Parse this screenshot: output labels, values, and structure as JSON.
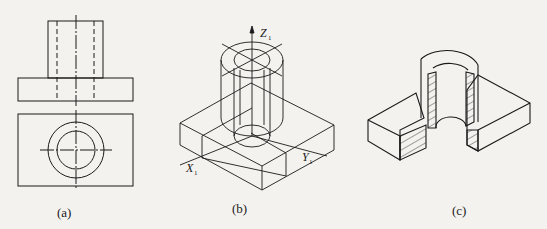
{
  "figures": [
    {
      "id": "a",
      "caption": "(a)",
      "description": "Orthographic front and top views"
    },
    {
      "id": "b",
      "caption": "(b)",
      "description": "Isometric drawing with axes"
    },
    {
      "id": "c",
      "caption": "(c)",
      "description": "Isometric cutaway section view"
    }
  ],
  "axes": {
    "z": {
      "letter": "Z",
      "sub": "1"
    },
    "x": {
      "letter": "X",
      "sub": "1"
    },
    "y": {
      "letter": "Y",
      "sub": "1"
    }
  },
  "colors": {
    "line": "#1a1a1a",
    "background": "#f4f2ef"
  }
}
